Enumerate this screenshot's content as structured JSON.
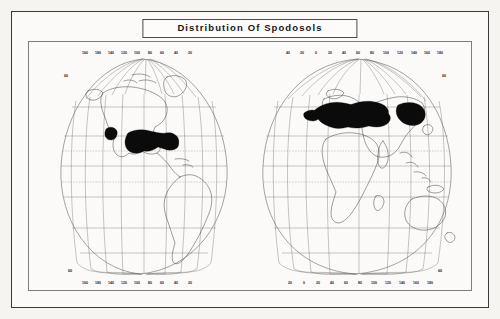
{
  "document": {
    "title": "Distribution Of Spodosols",
    "frame_style": "double-ruled-border",
    "background_color": "#f5f4f1",
    "ink_color": "#1c1c1c"
  },
  "map": {
    "projection": "two-hemisphere interrupted global projection",
    "shaded_legend_color": "#0b0b0b",
    "shaded_feature_name": "Spodosols",
    "graticule_color": "#6f6f6f",
    "coastline_color": "#2b2b2b",
    "tropic_line_style": "dashed",
    "longitude_labels_west_top": [
      "160",
      "180",
      "140",
      "120",
      "100",
      "80",
      "60",
      "40",
      "20"
    ],
    "longitude_labels_west_bottom": [
      "160",
      "180",
      "140",
      "120",
      "100",
      "80",
      "60",
      "40",
      "20"
    ],
    "longitude_labels_east_top": [
      "40",
      "20",
      "0",
      "20",
      "40",
      "60",
      "80",
      "100",
      "120",
      "140",
      "160",
      "180"
    ],
    "longitude_labels_east_bottom": [
      "20",
      "0",
      "20",
      "40",
      "60",
      "80",
      "100",
      "120",
      "140",
      "160",
      "180"
    ],
    "latitude_labels": [
      "60",
      "60",
      "60",
      "60"
    ],
    "latitude_values": [
      60,
      40,
      20,
      0,
      20,
      40,
      60
    ],
    "tropic_latitudes": [
      23.5,
      -23.5
    ],
    "spodosol_regions": [
      {
        "name": "northern-north-america",
        "hemisphere": "west"
      },
      {
        "name": "northeastern-united-states",
        "hemisphere": "west"
      },
      {
        "name": "alaska-patch",
        "hemisphere": "west"
      },
      {
        "name": "scandinavia-russia",
        "hemisphere": "east"
      },
      {
        "name": "central-siberia",
        "hemisphere": "east"
      },
      {
        "name": "eastern-siberia",
        "hemisphere": "east"
      }
    ]
  }
}
